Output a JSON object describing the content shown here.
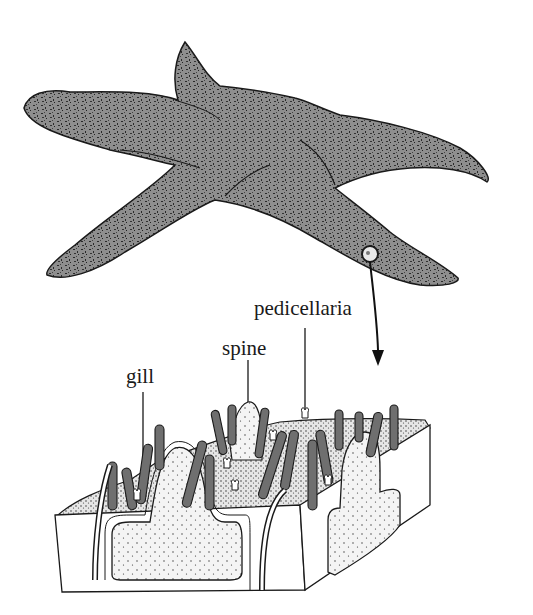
{
  "figure": {
    "labels": {
      "pedicellaria": "pedicellaria",
      "spine": "spine",
      "gill": "gill"
    },
    "colors": {
      "body_fill": "#8e8e8e",
      "body_speckle": "#2a2a2a",
      "gill_fill": "#6f6f6f",
      "outline": "#1a1a1a",
      "tissue_fill": "#f3f3f3",
      "background": "#ffffff"
    }
  }
}
